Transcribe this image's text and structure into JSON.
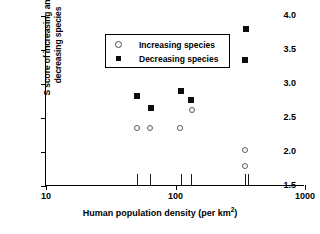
{
  "chart_data": {
    "type": "scatter",
    "title": "",
    "xlabel": "Human population density (per km2)",
    "xlabel_base": "Human population density (per km",
    "xlabel_sup": "2",
    "xlabel_tail": ")",
    "ylabel_line1": "S score of increasing and",
    "ylabel_line2": "decreasing species",
    "xscale": "log",
    "xlim": [
      10,
      1000
    ],
    "ylim": [
      1.5,
      4.0
    ],
    "xticks": [
      10,
      100,
      1000
    ],
    "xtick_labels": [
      "10",
      "100",
      "1000"
    ],
    "yticks": [
      1.5,
      2.0,
      2.5,
      3.0,
      3.5,
      4.0
    ],
    "ytick_labels": [
      "1.5",
      "2.0",
      "2.5",
      "3.0",
      "3.5",
      "4.0"
    ],
    "grid": false,
    "legend_position": "upper left",
    "rug_x": [
      50,
      63,
      110,
      132,
      346,
      360
    ],
    "series": [
      {
        "name": "Increasing species",
        "marker": "open-circle",
        "color": "#5a5a5a",
        "points": [
          {
            "x": 50,
            "y": 2.35
          },
          {
            "x": 63,
            "y": 2.35
          },
          {
            "x": 109,
            "y": 2.35
          },
          {
            "x": 134,
            "y": 2.62
          },
          {
            "x": 346,
            "y": 2.03
          },
          {
            "x": 346,
            "y": 1.8
          }
        ]
      },
      {
        "name": "Decreasing species",
        "marker": "filled-square",
        "color": "#0d0d0d",
        "points": [
          {
            "x": 50,
            "y": 2.83
          },
          {
            "x": 65,
            "y": 2.65
          },
          {
            "x": 110,
            "y": 2.89
          },
          {
            "x": 132,
            "y": 2.77
          },
          {
            "x": 346,
            "y": 3.35
          },
          {
            "x": 352,
            "y": 3.81
          }
        ]
      }
    ]
  },
  "legend": {
    "items": [
      {
        "label": "Increasing species",
        "marker": "open-circle"
      },
      {
        "label": "Decreasing species",
        "marker": "filled-square"
      }
    ]
  }
}
